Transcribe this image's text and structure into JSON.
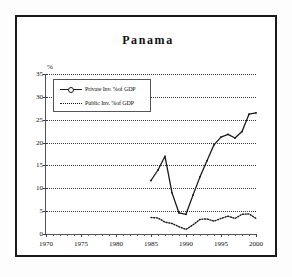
{
  "figure": {
    "title": "Panama",
    "background": "#ffffff",
    "frame_color": "#1a1a1a"
  },
  "legend": {
    "position": "top-left-inside",
    "entries": [
      {
        "label": "Private Inv. %of GDP",
        "style": "solid-with-markers",
        "color": "#1a1a1a"
      },
      {
        "label": "Public Inv. %of GDP",
        "style": "dotted",
        "color": "#1a1a1a"
      }
    ]
  },
  "axes": {
    "y_unit_label": "%",
    "y_ticks": [
      0,
      5,
      10,
      15,
      20,
      25,
      30,
      35
    ],
    "x_ticks": [
      1970,
      1975,
      1980,
      1985,
      1990,
      1995,
      2000
    ]
  },
  "chart_data": {
    "type": "line",
    "title": "Panama",
    "xlabel": "",
    "ylabel": "%",
    "xlim": [
      1970,
      2000
    ],
    "ylim": [
      0,
      35
    ],
    "grid": true,
    "legend_position": "upper left",
    "x": [
      1985,
      1986,
      1987,
      1988,
      1989,
      1990,
      1991,
      1992,
      1993,
      1994,
      1995,
      1996,
      1997,
      1998,
      1999,
      2000
    ],
    "series": [
      {
        "name": "Private Inv. %of GDP",
        "style": "solid",
        "values": [
          11.7,
          14.0,
          17.0,
          9.0,
          4.6,
          4.3,
          8.5,
          12.5,
          16.0,
          19.5,
          21.2,
          21.8,
          21.0,
          22.4,
          26.2,
          26.5
        ]
      },
      {
        "name": "Public Inv. %of GDP",
        "style": "dotted",
        "values": [
          3.6,
          3.5,
          2.6,
          2.3,
          1.6,
          1.0,
          2.0,
          3.2,
          3.3,
          2.8,
          3.4,
          3.9,
          3.4,
          4.3,
          4.4,
          3.4
        ]
      }
    ]
  }
}
